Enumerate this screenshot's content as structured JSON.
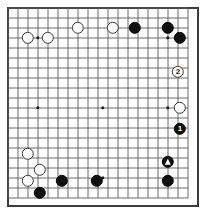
{
  "diagram": {
    "kind": "go-board-diagram",
    "board": {
      "columns": 19,
      "rows": 20,
      "cell_size": 10,
      "origin_x": 8,
      "origin_y": 8,
      "line_color": "#5a5a5a",
      "edge_color": "#3c3c3c",
      "background_color": "#ffffff"
    },
    "hoshi_points": [
      {
        "name": "hoshi-left-upper",
        "col": 3,
        "row": 3
      },
      {
        "name": "hoshi-left-center",
        "col": 3,
        "row": 10
      },
      {
        "name": "hoshi-center",
        "col": 9.5,
        "row": 10
      },
      {
        "name": "hoshi-right-center",
        "col": 16,
        "row": 10
      },
      {
        "name": "hoshi-right-upper",
        "col": 16,
        "row": 3
      },
      {
        "name": "hoshi-right-top-cluster",
        "col": 17,
        "row": 3
      },
      {
        "name": "hoshi-bottom-center",
        "col": 9.5,
        "row": 17
      },
      {
        "name": "hoshi-right-lower",
        "col": 16,
        "row": 17
      }
    ],
    "stones": [
      {
        "id": "w-a",
        "color": "white",
        "col": 2,
        "row": 3,
        "label": "",
        "mark": "none"
      },
      {
        "id": "w-b",
        "color": "white",
        "col": 4,
        "row": 3,
        "label": "",
        "mark": "none"
      },
      {
        "id": "w-c",
        "color": "white",
        "col": 7,
        "row": 2,
        "label": "",
        "mark": "none"
      },
      {
        "id": "w-d",
        "color": "white",
        "col": 10.5,
        "row": 2,
        "label": "",
        "mark": "none"
      },
      {
        "id": "b-a",
        "color": "black",
        "col": 12.7,
        "row": 2,
        "label": "",
        "mark": "none"
      },
      {
        "id": "b-b",
        "color": "black",
        "col": 16,
        "row": 2,
        "label": "",
        "mark": "none"
      },
      {
        "id": "b-c",
        "color": "black",
        "col": 17.2,
        "row": 3,
        "label": "",
        "mark": "none"
      },
      {
        "id": "w-2",
        "color": "white",
        "col": 17,
        "row": 6.4,
        "label": "2",
        "mark": "number"
      },
      {
        "id": "w-e",
        "color": "white",
        "col": 17.2,
        "row": 10,
        "label": "",
        "mark": "none"
      },
      {
        "id": "b-1",
        "color": "black",
        "col": 17.2,
        "row": 12.1,
        "label": "1",
        "mark": "number"
      },
      {
        "id": "w-f",
        "color": "white",
        "col": 2,
        "row": 14.6,
        "label": "",
        "mark": "none"
      },
      {
        "id": "w-g",
        "color": "white",
        "col": 3.2,
        "row": 16.2,
        "label": "",
        "mark": "none"
      },
      {
        "id": "b-tri",
        "color": "black",
        "col": 16,
        "row": 15.4,
        "label": "",
        "mark": "triangle"
      },
      {
        "id": "w-h",
        "color": "white",
        "col": 2,
        "row": 17.3,
        "label": "",
        "mark": "none"
      },
      {
        "id": "b-d",
        "color": "black",
        "col": 5.4,
        "row": 17.3,
        "label": "",
        "mark": "none"
      },
      {
        "id": "b-e",
        "color": "black",
        "col": 8.9,
        "row": 17.3,
        "label": "",
        "mark": "none"
      },
      {
        "id": "b-f",
        "color": "black",
        "col": 16,
        "row": 17.3,
        "label": "",
        "mark": "none"
      },
      {
        "id": "b-g",
        "color": "black",
        "col": 3.2,
        "row": 18.5,
        "label": "",
        "mark": "none"
      }
    ],
    "legend": {
      "move_1_label": "1",
      "move_2_label": "2",
      "triangle_mark_label": "triangle"
    }
  }
}
